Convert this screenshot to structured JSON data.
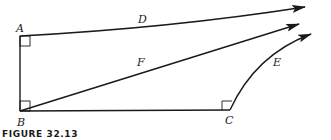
{
  "figure": {
    "caption": "FIGURE 32.13",
    "points": {
      "A": {
        "label": "A",
        "x": 20,
        "y": 36
      },
      "B": {
        "label": "B",
        "x": 20,
        "y": 111
      },
      "C": {
        "label": "C",
        "x": 230,
        "y": 110
      }
    },
    "vectors": {
      "D": {
        "label": "D"
      },
      "E": {
        "label": "E"
      },
      "F": {
        "label": "F"
      }
    },
    "colors": {
      "ink": "#1a1a1a",
      "background": "#ffffff"
    }
  }
}
